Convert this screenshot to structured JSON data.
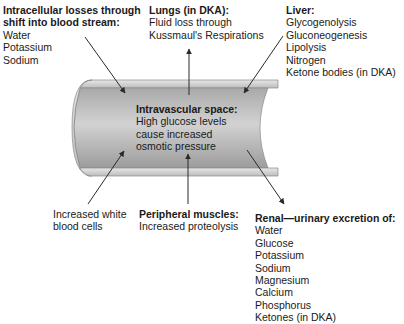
{
  "intracellular": {
    "title_line1": "Intracellular losses through",
    "title_line2": "shift into blood stream:",
    "items": [
      "Water",
      "Potassium",
      "Sodium"
    ]
  },
  "lungs": {
    "title": "Lungs (in DKA):",
    "items": [
      "Fluid loss through",
      "Kussmaul's Respirations"
    ]
  },
  "liver": {
    "title": "Liver:",
    "items": [
      "Glycogenolysis",
      "Gluconeogenesis",
      "Lipolysis",
      "Nitrogen",
      "Ketone bodies (in DKA)"
    ]
  },
  "intravascular": {
    "title": "Intravascular space:",
    "items": [
      "High glucose levels",
      "cause increased",
      "osmotic pressure"
    ]
  },
  "wbc": {
    "items": [
      "Increased white",
      "blood cells"
    ]
  },
  "muscles": {
    "title": "Peripheral muscles:",
    "items": [
      "Increased proteolysis"
    ]
  },
  "renal": {
    "title": "Renal—urinary excretion of:",
    "items": [
      "Water",
      "Glucose",
      "Potassium",
      "Sodium",
      "Magnesium",
      "Calcium",
      "Phosphorus",
      "Ketones (in DKA)"
    ]
  },
  "colors": {
    "vessel_fill": "#b5b5b5",
    "vessel_wall": "#d8d8d8",
    "arrow": "#2a2a2a"
  }
}
